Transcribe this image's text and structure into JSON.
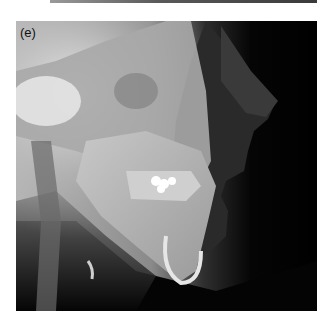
{
  "figure": {
    "panel_label": "(e)",
    "colors": {
      "background": "#ffffff",
      "soft_tissue_dark": "#000000",
      "bone_light": "#d8d8d8",
      "dental_restoration": "#ffffff"
    }
  }
}
